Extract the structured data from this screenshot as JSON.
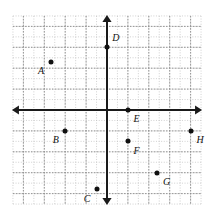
{
  "figure": {
    "kind": "coordinate-plane"
  },
  "chart_data": {
    "type": "scatter",
    "title": "",
    "xlabel": "",
    "ylabel": "",
    "xlim": [
      -4.5,
      4.5
    ],
    "ylim": [
      -4.5,
      4.5
    ],
    "grid": true,
    "grid_step": 1,
    "minor_grid": true,
    "minor_grid_step": 0.5,
    "legend": "none",
    "axes": {
      "x_axis_label": "",
      "y_axis_label": "",
      "arrows": [
        "left",
        "right",
        "up",
        "down"
      ],
      "tick_labels": []
    },
    "points": [
      {
        "label": "A",
        "x": -2.7,
        "y": 2.3,
        "label_dx": -0.45,
        "label_dy": 0.45
      },
      {
        "label": "B",
        "x": -2.0,
        "y": -1.0,
        "label_dx": -0.45,
        "label_dy": 0.45
      },
      {
        "label": "C",
        "x": -0.5,
        "y": -3.8,
        "label_dx": -0.45,
        "label_dy": 0.45
      },
      {
        "label": "D",
        "x": 0.0,
        "y": 3.0,
        "label_dx": 0.42,
        "label_dy": -0.45
      },
      {
        "label": "E",
        "x": 1.0,
        "y": 0.0,
        "label_dx": 0.42,
        "label_dy": 0.45
      },
      {
        "label": "F",
        "x": 1.0,
        "y": -1.5,
        "label_dx": 0.42,
        "label_dy": 0.45
      },
      {
        "label": "G",
        "x": 2.4,
        "y": -3.0,
        "label_dx": 0.45,
        "label_dy": 0.45
      },
      {
        "label": "H",
        "x": 4.0,
        "y": -1.0,
        "label_dx": 0.45,
        "label_dy": 0.45
      }
    ]
  },
  "colors": {
    "axis": "#1a1a1a",
    "major_grid": "#8c8c8c",
    "minor_grid": "#bdbdbd",
    "point": "#111111",
    "label": "#111111",
    "background": "#ffffff"
  }
}
